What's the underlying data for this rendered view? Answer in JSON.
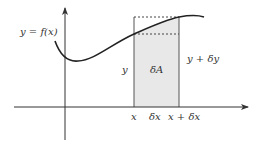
{
  "diagram": {
    "colors": {
      "axis": "#333333",
      "curve": "#222222",
      "strip_fill": "#e8e8e8",
      "strip_stroke": "#555555",
      "dashed": "#444444",
      "text": "#333333"
    },
    "labels": {
      "curve": "y = f(x)",
      "left_height": "y",
      "area": "δA",
      "right_height": "y + δy",
      "x_left": "x",
      "width": "δx",
      "x_right": "x + δx"
    }
  }
}
